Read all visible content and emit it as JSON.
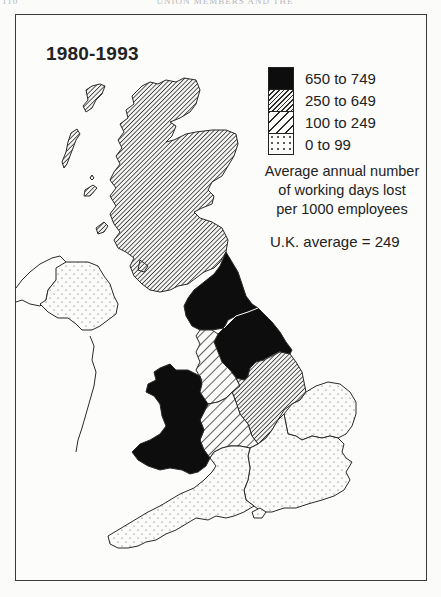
{
  "running_head": {
    "page_number": "110",
    "title": "UNION MEMBERS AND THE REGIONS"
  },
  "map": {
    "title": "1980-1993",
    "legend": {
      "items": [
        {
          "label": "650 to 749",
          "pattern": "solid-black"
        },
        {
          "label": "250 to 649",
          "pattern": "dense-hatch"
        },
        {
          "label": "100 to 249",
          "pattern": "wide-hatch"
        },
        {
          "label": "0 to 99",
          "pattern": "dots"
        }
      ],
      "note_lines": [
        "Average annual number",
        "of working days lost",
        "per 1000 employees"
      ]
    },
    "uk_average": "U.K. average = 249",
    "regions": [
      {
        "name": "Scotland",
        "class": "250 to 649"
      },
      {
        "name": "North",
        "class": "650 to 749"
      },
      {
        "name": "Yorkshire and Humberside",
        "class": "650 to 749"
      },
      {
        "name": "North West",
        "class": "100 to 249"
      },
      {
        "name": "East Midlands",
        "class": "250 to 649"
      },
      {
        "name": "West Midlands",
        "class": "100 to 249"
      },
      {
        "name": "Wales",
        "class": "650 to 749"
      },
      {
        "name": "East Anglia",
        "class": "0 to 99"
      },
      {
        "name": "South East",
        "class": "0 to 99"
      },
      {
        "name": "South West",
        "class": "0 to 99"
      },
      {
        "name": "Northern Ireland",
        "class": "0 to 99"
      }
    ]
  },
  "colors": {
    "black_fill": "#0d0d0d",
    "outline": "#2a2a2a",
    "paper": "#fcfcfb"
  }
}
